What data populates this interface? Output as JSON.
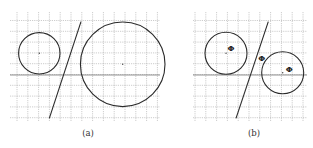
{
  "figure": {
    "width": 313,
    "height": 148,
    "colors": {
      "background": "#ffffff",
      "grid": "#9a9a9a",
      "axis": "#7a7a7a",
      "stroke": "#2a2a2a"
    },
    "panels": [
      {
        "id": "a",
        "caption": "(a)",
        "caption_pos": [
          88,
          136
        ],
        "grid": {
          "x0": 10,
          "x1": 160,
          "y0": 12,
          "y1": 122,
          "spacing": 10.8,
          "first_x": 17,
          "first_y": 20.5
        },
        "axis": {
          "y": 75
        },
        "circles": [
          {
            "cx": 39.3,
            "cy": 53.3,
            "r": 20.7
          },
          {
            "cx": 122.7,
            "cy": 64.3,
            "r": 42.3
          }
        ],
        "lines": [
          {
            "x1": 81,
            "y1": 21.7,
            "x2": 49.3,
            "y2": 118.3
          }
        ],
        "labels": []
      },
      {
        "id": "b",
        "caption": "(b)",
        "caption_pos": [
          254,
          136
        ],
        "grid": {
          "x0": 193,
          "x1": 307,
          "y0": 12,
          "y1": 122,
          "spacing": 10.8,
          "first_x": 195,
          "first_y": 20.5
        },
        "axis": {
          "y": 75
        },
        "circles": [
          {
            "cx": 226,
            "cy": 53.3,
            "r": 21
          },
          {
            "cx": 282.7,
            "cy": 72.7,
            "r": 21
          }
        ],
        "lines": [
          {
            "x1": 268.3,
            "y1": 21.7,
            "x2": 236,
            "y2": 118.3
          }
        ],
        "labels": [
          {
            "text": "Φ",
            "x": 231,
            "y": 51
          },
          {
            "text": "Φ",
            "x": 261.7,
            "y": 61
          },
          {
            "text": "Φ",
            "x": 289.3,
            "y": 72
          }
        ]
      }
    ]
  }
}
